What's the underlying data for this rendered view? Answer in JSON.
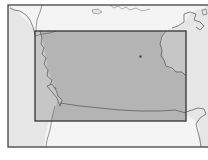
{
  "map": {
    "type": "locator-map",
    "colors": {
      "background": "#ffffff",
      "ocean": "#f4f4f4",
      "land": "#e6e6e6",
      "highlight_area": "#b4b4b4",
      "coastline": "#555555",
      "frame": "#333333"
    },
    "outer_frame": {
      "x": 8,
      "y": 5,
      "w": 206,
      "h": 142
    },
    "highlight_box": {
      "x": 35,
      "y": 31,
      "w": 151,
      "h": 90
    },
    "point_marker": {
      "x": 140,
      "y": 56
    }
  }
}
